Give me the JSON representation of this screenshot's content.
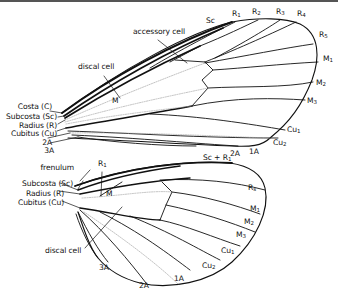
{
  "figure": {
    "colors": {
      "vein": "#111111",
      "faint_vein": "#9a9a9a",
      "background": "#ffffff"
    }
  },
  "forewing": {
    "left_labels": {
      "costa": "Costa (C)",
      "subcosta": "Subcosta (Sc)",
      "radius": "Radius (R)",
      "cubitus": "Cubitus (Cu)",
      "a2": "2A",
      "a3": "3A"
    },
    "callouts": {
      "accessory_cell": "accessory cell",
      "discal_cell": "discal cell",
      "m": "M"
    },
    "margin_labels": {
      "sc": "Sc",
      "r1": "R",
      "r1_sub": "1",
      "r2": "R",
      "r2_sub": "2",
      "r3": "R",
      "r3_sub": "3",
      "r4": "R",
      "r4_sub": "4",
      "r5": "R",
      "r5_sub": "5",
      "m1": "M",
      "m1_sub": "1",
      "m2": "M",
      "m2_sub": "2",
      "m3": "M",
      "m3_sub": "3",
      "cu1": "Cu",
      "cu1_sub": "1",
      "cu2": "Cu",
      "cu2_sub": "2",
      "a1": "1A",
      "a2_margin": "2A"
    }
  },
  "hindwing": {
    "left_labels": {
      "frenulum": "frenulum",
      "subcosta": "Subcosta (Sc)",
      "radius": "Radius (R)",
      "cubitus": "Cubitus (Cu)"
    },
    "callouts": {
      "r1": "R",
      "r1_sub": "1",
      "m": "M",
      "discal_cell": "discal cell"
    },
    "margin_labels": {
      "sc_r1": "Sc + R",
      "sc_r1_sub": "1",
      "rs": "R",
      "rs_sub": "s",
      "m1": "M",
      "m1_sub": "1",
      "m2": "M",
      "m2_sub": "2",
      "m3": "M",
      "m3_sub": "3",
      "cu1": "Cu",
      "cu1_sub": "1",
      "cu2": "Cu",
      "cu2_sub": "2",
      "a1": "1A",
      "a2": "2A",
      "a3": "3A"
    }
  }
}
